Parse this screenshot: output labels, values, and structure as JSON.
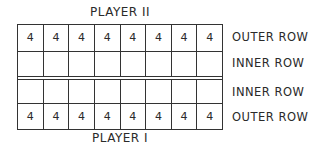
{
  "players": {
    "top": "PLAYER II",
    "bottom": "PLAYER I"
  },
  "row_labels": [
    "OUTER ROW",
    "INNER ROW",
    "INNER ROW",
    "OUTER ROW"
  ],
  "board": {
    "rows": [
      [
        "4",
        "4",
        "4",
        "4",
        "4",
        "4",
        "4",
        "4"
      ],
      [
        "",
        "",
        "",
        "",
        "",
        "",
        "",
        ""
      ],
      [
        "",
        "",
        "",
        "",
        "",
        "",
        "",
        ""
      ],
      [
        "4",
        "4",
        "4",
        "4",
        "4",
        "4",
        "4",
        "4"
      ]
    ]
  }
}
